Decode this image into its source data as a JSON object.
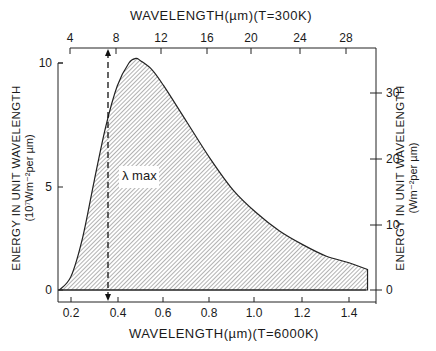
{
  "chart_data": {
    "type": "area",
    "title": "",
    "top_xlabel": "WAVELENGTH(µm)(T=300K)",
    "bottom_xlabel": "WAVELENGTH(µm)(T=6000K)",
    "left_ylabel": "ENERGY IN UNIT WAVELENGTH",
    "left_ylabel_units": "(10⁷Wm⁻²per µm)",
    "right_ylabel": "ENERGY IN UNIT WAVELENGTH",
    "right_ylabel_units": "(Wm⁻²per µm)",
    "annotation": "λ max",
    "top_xticks": [
      "4",
      "8",
      "12",
      "16",
      "20",
      "24",
      "28"
    ],
    "bottom_xticks": [
      "0.2",
      "0.4",
      "0.6",
      "0.8",
      "1.0",
      "1.2",
      "1.4"
    ],
    "left_yticks": [
      "0",
      "5",
      "10"
    ],
    "right_yticks": [
      "0",
      "10",
      "20",
      "30"
    ],
    "xlim_bottom": [
      0.15,
      1.5
    ],
    "xlim_top": [
      3.5,
      30
    ],
    "ylim_left": [
      0,
      10.5
    ],
    "ylim_right": [
      0,
      32
    ],
    "grid": false,
    "fill": "hatched",
    "lambda_max_um_6000K": 0.48,
    "lambda_max_um_300K": 9.7,
    "x": [
      0.15,
      0.2,
      0.25,
      0.3,
      0.35,
      0.4,
      0.45,
      0.48,
      0.5,
      0.55,
      0.6,
      0.7,
      0.8,
      0.9,
      1.0,
      1.1,
      1.2,
      1.3,
      1.4,
      1.48
    ],
    "series": [
      {
        "name": "Blackbody T=6000K (left axis, 10^7 Wm^-2 per µm)",
        "values": [
          0.0,
          0.6,
          2.3,
          4.8,
          7.2,
          9.0,
          10.0,
          10.2,
          10.1,
          9.7,
          9.0,
          7.4,
          5.8,
          4.4,
          3.4,
          2.6,
          2.0,
          1.5,
          1.2,
          0.9
        ]
      }
    ]
  },
  "ticks_px": {
    "top": [
      70,
      116,
      161,
      207,
      251,
      300,
      346
    ],
    "bottom": [
      71,
      118,
      163,
      209,
      254,
      302,
      349
    ],
    "left": [
      290,
      187,
      63
    ],
    "right": [
      290,
      225,
      159,
      93
    ]
  }
}
